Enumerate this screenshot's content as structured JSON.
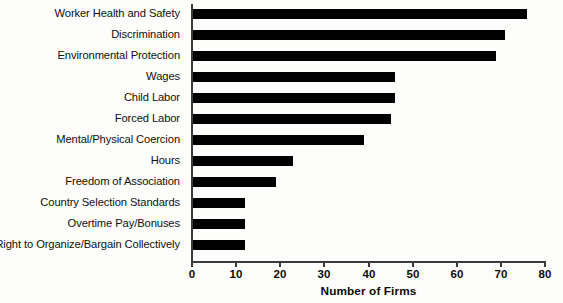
{
  "chart_data": {
    "type": "bar",
    "orientation": "horizontal",
    "title": "",
    "xlabel": "Number of Firms",
    "ylabel": "",
    "xlim": [
      0,
      80
    ],
    "xticks": [
      0,
      10,
      20,
      30,
      40,
      50,
      60,
      70,
      80
    ],
    "grid": false,
    "legend": null,
    "bar_color": "#000000",
    "background_color": "#fdfdfb",
    "axis_color": "#3a3a3a",
    "categories": [
      "Worker Health and Safety",
      "Discrimination",
      "Environmental Protection",
      "Wages",
      "Child Labor",
      "Forced Labor",
      "Mental/Physical Coercion",
      "Hours",
      "Freedom of Association",
      "Country Selection Standards",
      "Overtime Pay/Bonuses",
      "Right to Organize/Bargain Collectively"
    ],
    "values": [
      76,
      71,
      69,
      46,
      46,
      45,
      39,
      23,
      19,
      12,
      12,
      12
    ]
  }
}
